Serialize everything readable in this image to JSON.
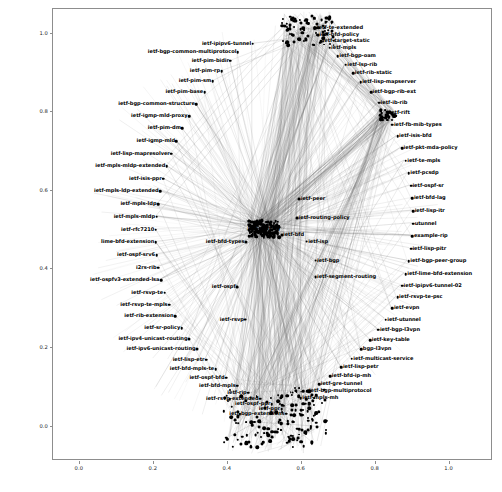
{
  "figure": {
    "background_color": "#ffffff",
    "axes_border_color": "#8d8d8d",
    "node_color": "#000000",
    "edge_color": "#6e6e6e"
  },
  "axes": {
    "xticks": [
      "0.0",
      "0.2",
      "0.4",
      "0.6",
      "0.8",
      "1.0"
    ],
    "xtick_values": [
      0.0,
      0.2,
      0.4,
      0.6,
      0.8,
      1.0
    ],
    "yticks": [
      "0.0",
      "0.2",
      "0.4",
      "0.6",
      "0.8",
      "1.0"
    ],
    "ytick_values": [
      0.0,
      0.2,
      0.4,
      0.6,
      0.8,
      1.0
    ],
    "xlim": [
      -0.07,
      1.12
    ],
    "ylim": [
      -0.09,
      1.06
    ],
    "grid": false,
    "title": "",
    "xlabel": "",
    "ylabel": ""
  },
  "chart_data": {
    "type": "scatter",
    "title": "",
    "xlabel": "",
    "ylabel": "",
    "xlim": [
      -0.07,
      1.12
    ],
    "ylim": [
      -0.09,
      1.06
    ],
    "grid": false,
    "legend": "none",
    "nodes": [
      {
        "label": "ietf-te-extended",
        "x": 0.64,
        "y": 1.012,
        "size": 3.0,
        "anchor": "left"
      },
      {
        "label": "ietf-bfd-policy",
        "x": 0.646,
        "y": 0.994,
        "size": 3.0,
        "anchor": "left"
      },
      {
        "label": "ietf-target-static",
        "x": 0.655,
        "y": 0.978,
        "size": 2.6,
        "anchor": "left"
      },
      {
        "label": "ietf-mpls",
        "x": 0.678,
        "y": 0.962,
        "size": 2.6,
        "anchor": "left"
      },
      {
        "label": "ietf-bgp-oam",
        "x": 0.7,
        "y": 0.94,
        "size": 2.6,
        "anchor": "left"
      },
      {
        "label": "ietf-lsp-rib",
        "x": 0.722,
        "y": 0.918,
        "size": 2.6,
        "anchor": "left"
      },
      {
        "label": "ietf-rib-static",
        "x": 0.742,
        "y": 0.896,
        "size": 2.6,
        "anchor": "left"
      },
      {
        "label": "ietf-lisp-mapserver",
        "x": 0.762,
        "y": 0.874,
        "size": 2.6,
        "anchor": "left"
      },
      {
        "label": "ietf-bgp-rib-ext",
        "x": 0.79,
        "y": 0.848,
        "size": 2.6,
        "anchor": "left"
      },
      {
        "label": "ietf-ib-rib",
        "x": 0.812,
        "y": 0.822,
        "size": 2.6,
        "anchor": "left"
      },
      {
        "label": "ietf-rift",
        "x": 0.836,
        "y": 0.796,
        "size": 2.6,
        "anchor": "left"
      },
      {
        "label": "ietf-fb-mib-types",
        "x": 0.848,
        "y": 0.766,
        "size": 2.6,
        "anchor": "left"
      },
      {
        "label": "ietf-isis-bfd",
        "x": 0.862,
        "y": 0.736,
        "size": 2.6,
        "anchor": "left"
      },
      {
        "label": "ietf-pkt-mda-policy",
        "x": 0.874,
        "y": 0.706,
        "size": 2.6,
        "anchor": "left"
      },
      {
        "label": "ietf-te-mpls",
        "x": 0.884,
        "y": 0.674,
        "size": 2.6,
        "anchor": "left"
      },
      {
        "label": "ietf-pcsdp",
        "x": 0.892,
        "y": 0.642,
        "size": 2.6,
        "anchor": "left"
      },
      {
        "label": "ietf-ospf-sr",
        "x": 0.898,
        "y": 0.61,
        "size": 2.6,
        "anchor": "left"
      },
      {
        "label": "ietf-bfd-lag",
        "x": 0.902,
        "y": 0.578,
        "size": 2.6,
        "anchor": "left"
      },
      {
        "label": "ietf-lisp-itr",
        "x": 0.904,
        "y": 0.546,
        "size": 2.6,
        "anchor": "left"
      },
      {
        "label": "utunnel",
        "x": 0.904,
        "y": 0.514,
        "size": 2.6,
        "anchor": "left"
      },
      {
        "label": "example-rip",
        "x": 0.902,
        "y": 0.482,
        "size": 2.6,
        "anchor": "left"
      },
      {
        "label": "ietf-lisp-pitr",
        "x": 0.898,
        "y": 0.45,
        "size": 2.6,
        "anchor": "left"
      },
      {
        "label": "ietf-bgp-peer-group",
        "x": 0.892,
        "y": 0.418,
        "size": 2.6,
        "anchor": "left"
      },
      {
        "label": "ietf-lime-bfd-extension",
        "x": 0.884,
        "y": 0.386,
        "size": 2.6,
        "anchor": "left"
      },
      {
        "label": "ietf-ipipv6-tunnel-02",
        "x": 0.874,
        "y": 0.356,
        "size": 2.6,
        "anchor": "left"
      },
      {
        "label": "ietf-rsvp-te-psc",
        "x": 0.862,
        "y": 0.326,
        "size": 2.6,
        "anchor": "left"
      },
      {
        "label": "ietf-evpn",
        "x": 0.848,
        "y": 0.298,
        "size": 2.6,
        "anchor": "left"
      },
      {
        "label": "ietf-utunnel",
        "x": 0.83,
        "y": 0.27,
        "size": 2.6,
        "anchor": "left"
      },
      {
        "label": "ietf-bgp-l3vpn",
        "x": 0.81,
        "y": 0.244,
        "size": 2.6,
        "anchor": "left"
      },
      {
        "label": "ietf-key-table",
        "x": 0.788,
        "y": 0.218,
        "size": 2.6,
        "anchor": "left"
      },
      {
        "label": "bgp-l3vpn",
        "x": 0.764,
        "y": 0.194,
        "size": 2.6,
        "anchor": "left"
      },
      {
        "label": "ietf-multicast-service",
        "x": 0.738,
        "y": 0.17,
        "size": 2.6,
        "anchor": "left"
      },
      {
        "label": "ietf-lisp-petr",
        "x": 0.71,
        "y": 0.148,
        "size": 2.6,
        "anchor": "left"
      },
      {
        "label": "ietf-bfd-ip-mh",
        "x": 0.68,
        "y": 0.126,
        "size": 2.6,
        "anchor": "left"
      },
      {
        "label": "ietf-gre-tunnel",
        "x": 0.65,
        "y": 0.106,
        "size": 2.6,
        "anchor": "left"
      },
      {
        "label": "ietf-bgp-multiprotocol",
        "x": 0.618,
        "y": 0.088,
        "size": 2.6,
        "anchor": "left"
      },
      {
        "label": "ietf-mpls-mh",
        "x": 0.6,
        "y": 0.07,
        "size": 2.6,
        "anchor": "left"
      },
      {
        "label": "ietf-segment-routing",
        "x": 0.64,
        "y": 0.378,
        "size": 2.8,
        "anchor": "left"
      },
      {
        "label": "ietf-ipipv6-tunnel",
        "x": 0.47,
        "y": 0.972,
        "size": 2.6,
        "anchor": "right"
      },
      {
        "label": "ietf-bgp-common-multiprotocol",
        "x": 0.43,
        "y": 0.95,
        "size": 2.6,
        "anchor": "right"
      },
      {
        "label": "ietf-pim-bidir",
        "x": 0.41,
        "y": 0.928,
        "size": 2.6,
        "anchor": "right"
      },
      {
        "label": "ietf-pim-rp",
        "x": 0.386,
        "y": 0.902,
        "size": 2.6,
        "anchor": "right"
      },
      {
        "label": "ietf-pim-sm",
        "x": 0.362,
        "y": 0.876,
        "size": 2.6,
        "anchor": "right"
      },
      {
        "label": "ietf-pim-base",
        "x": 0.34,
        "y": 0.848,
        "size": 2.6,
        "anchor": "right"
      },
      {
        "label": "ietf-bgp-common-structure",
        "x": 0.318,
        "y": 0.818,
        "size": 2.6,
        "anchor": "right"
      },
      {
        "label": "ietf-igmp-mld-proxy",
        "x": 0.298,
        "y": 0.788,
        "size": 2.6,
        "anchor": "right"
      },
      {
        "label": "ietf-pim-dm",
        "x": 0.28,
        "y": 0.756,
        "size": 2.6,
        "anchor": "right"
      },
      {
        "label": "ietf-igmp-mld",
        "x": 0.264,
        "y": 0.724,
        "size": 2.6,
        "anchor": "right"
      },
      {
        "label": "ietf-lisp-mapresolver",
        "x": 0.25,
        "y": 0.692,
        "size": 2.6,
        "anchor": "right"
      },
      {
        "label": "ietf-mpls-mldp-extended",
        "x": 0.238,
        "y": 0.66,
        "size": 2.6,
        "anchor": "right"
      },
      {
        "label": "ietf-isis-ppr",
        "x": 0.228,
        "y": 0.628,
        "size": 2.6,
        "anchor": "right"
      },
      {
        "label": "ietf-mpls-ldp-extended",
        "x": 0.22,
        "y": 0.596,
        "size": 2.6,
        "anchor": "right"
      },
      {
        "label": "ietf-mpls-ldp",
        "x": 0.214,
        "y": 0.564,
        "size": 2.6,
        "anchor": "right"
      },
      {
        "label": "ietf-mpls-mldp",
        "x": 0.21,
        "y": 0.532,
        "size": 2.6,
        "anchor": "right"
      },
      {
        "label": "ietf-rfc7210",
        "x": 0.208,
        "y": 0.498,
        "size": 2.6,
        "anchor": "right"
      },
      {
        "label": "lime-bfd-extension",
        "x": 0.208,
        "y": 0.466,
        "size": 2.6,
        "anchor": "right"
      },
      {
        "label": "ietf-ospf-srv6",
        "x": 0.21,
        "y": 0.434,
        "size": 2.6,
        "anchor": "right"
      },
      {
        "label": "i2rs-rib",
        "x": 0.214,
        "y": 0.402,
        "size": 2.6,
        "anchor": "right"
      },
      {
        "label": "ietf-ospfv3-extended-lsa",
        "x": 0.222,
        "y": 0.37,
        "size": 2.6,
        "anchor": "right"
      },
      {
        "label": "ietf-rsvp-te",
        "x": 0.232,
        "y": 0.338,
        "size": 2.6,
        "anchor": "right"
      },
      {
        "label": "ietf-rsvp-te-mpls",
        "x": 0.244,
        "y": 0.308,
        "size": 2.6,
        "anchor": "right"
      },
      {
        "label": "ietf-rib-extension",
        "x": 0.26,
        "y": 0.278,
        "size": 2.6,
        "anchor": "right"
      },
      {
        "label": "ietf-sr-policy",
        "x": 0.278,
        "y": 0.248,
        "size": 2.6,
        "anchor": "right"
      },
      {
        "label": "ietf-ipv4-unicast-routing",
        "x": 0.298,
        "y": 0.22,
        "size": 3.0,
        "anchor": "right"
      },
      {
        "label": "ietf-ipv6-unicast-routing",
        "x": 0.32,
        "y": 0.194,
        "size": 3.0,
        "anchor": "right"
      },
      {
        "label": "ietf-lisp-etr",
        "x": 0.344,
        "y": 0.168,
        "size": 2.6,
        "anchor": "right"
      },
      {
        "label": "ietf-bfd-mpls-te",
        "x": 0.37,
        "y": 0.144,
        "size": 2.6,
        "anchor": "right"
      },
      {
        "label": "ietf-ospf-bfd",
        "x": 0.398,
        "y": 0.122,
        "size": 2.6,
        "anchor": "right"
      },
      {
        "label": "ietf-bfd-mpls",
        "x": 0.428,
        "y": 0.102,
        "size": 2.6,
        "anchor": "right"
      },
      {
        "label": "ietf-rip",
        "x": 0.458,
        "y": 0.084,
        "size": 2.6,
        "anchor": "right"
      },
      {
        "label": "ietf-rsvp-extended",
        "x": 0.49,
        "y": 0.068,
        "size": 2.6,
        "anchor": "right"
      },
      {
        "label": "ietf-ospf-ppr",
        "x": 0.522,
        "y": 0.054,
        "size": 2.6,
        "anchor": "right"
      },
      {
        "label": "ietf-ppr",
        "x": 0.548,
        "y": 0.042,
        "size": 2.6,
        "anchor": "right"
      },
      {
        "label": "ietf-bgp-extensions",
        "x": 0.56,
        "y": 0.03,
        "size": 2.6,
        "anchor": "right"
      },
      {
        "label": "ietf-peer",
        "x": 0.596,
        "y": 0.576,
        "size": 2.8,
        "anchor": "left"
      },
      {
        "label": "ietf-routing-policy",
        "x": 0.59,
        "y": 0.528,
        "size": 2.8,
        "anchor": "left"
      },
      {
        "label": "ietf-bfd",
        "x": 0.548,
        "y": 0.486,
        "size": 3.2,
        "anchor": "left"
      },
      {
        "label": "ietf-isp",
        "x": 0.616,
        "y": 0.468,
        "size": 2.8,
        "anchor": "left"
      },
      {
        "label": "ietf-bgp",
        "x": 0.64,
        "y": 0.42,
        "size": 2.8,
        "anchor": "left"
      },
      {
        "label": "ietf-routing",
        "x": 0.5,
        "y": 0.5,
        "size": 7.0,
        "anchor": "center"
      },
      {
        "label": "ietf-bfd-types",
        "x": 0.452,
        "y": 0.468,
        "size": 3.2,
        "anchor": "right"
      },
      {
        "label": "ietf-ospf",
        "x": 0.428,
        "y": 0.352,
        "size": 2.8,
        "anchor": "right"
      },
      {
        "label": "ietf-rsvp",
        "x": 0.45,
        "y": 0.27,
        "size": 2.8,
        "anchor": "right"
      }
    ],
    "hub_clusters": [
      {
        "name": "center-hub",
        "x": 0.5,
        "y": 0.5,
        "radius": 0.035,
        "density": "very-high"
      },
      {
        "name": "bottom-cluster",
        "x": 0.53,
        "y": 0.02,
        "radius": 0.12,
        "density": "very-high"
      },
      {
        "name": "top-cluster",
        "x": 0.62,
        "y": 1.005,
        "radius": 0.06,
        "density": "high"
      },
      {
        "name": "right-mid-cluster",
        "x": 0.836,
        "y": 0.79,
        "radius": 0.02,
        "density": "medium"
      }
    ]
  }
}
